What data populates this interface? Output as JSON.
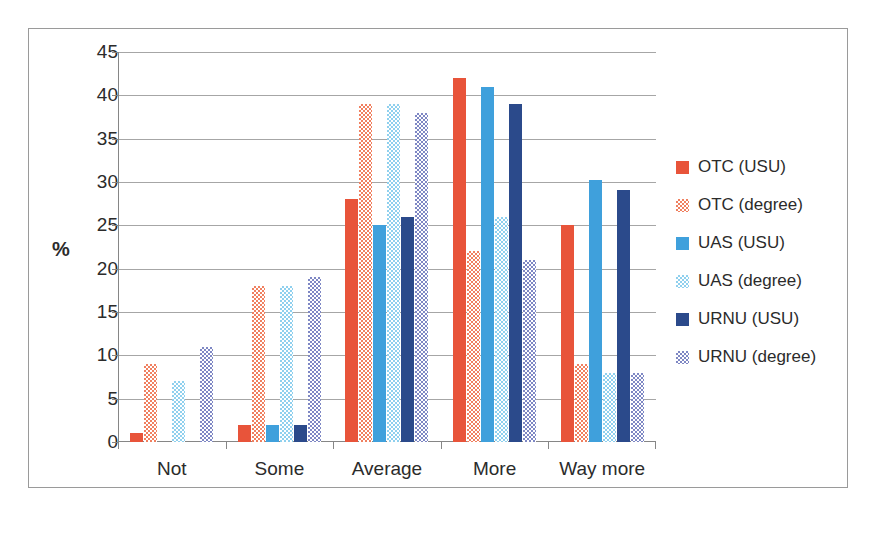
{
  "chart_data": {
    "type": "bar",
    "title": "",
    "xlabel": "",
    "ylabel": "%",
    "ylim": [
      0,
      45
    ],
    "yticks": [
      0,
      5,
      10,
      15,
      20,
      25,
      30,
      35,
      40,
      45
    ],
    "grid": true,
    "legend_position": "right",
    "categories": [
      "Not",
      "Some",
      "Average",
      "More",
      "Way more"
    ],
    "series": [
      {
        "name": "OTC (USU)",
        "color": "#E8543A",
        "pattern": "solid",
        "values": [
          1,
          2,
          28,
          42,
          25
        ]
      },
      {
        "name": "OTC (degree)",
        "color": "#F08060",
        "pattern": "checkered",
        "values": [
          9,
          18,
          39,
          22,
          9
        ]
      },
      {
        "name": "UAS (USU)",
        "color": "#3FA0DC",
        "pattern": "solid",
        "values": [
          0,
          2,
          25,
          41,
          30.2
        ]
      },
      {
        "name": "UAS (degree)",
        "color": "#8FD0EE",
        "pattern": "checkered",
        "values": [
          7,
          18,
          39,
          26,
          8
        ]
      },
      {
        "name": "URNU (USU)",
        "color": "#2B4A8B",
        "pattern": "solid",
        "values": [
          0,
          2,
          26,
          39,
          29.1
        ]
      },
      {
        "name": "URNU (degree)",
        "color": "#7E87C4",
        "pattern": "checkered",
        "values": [
          11,
          19,
          38,
          21,
          8
        ]
      }
    ]
  }
}
